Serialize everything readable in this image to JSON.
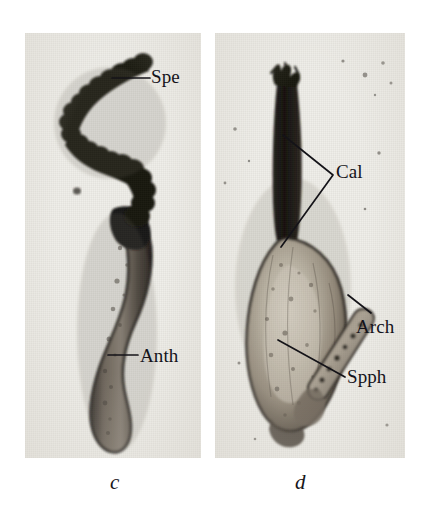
{
  "figure": {
    "kind": "micrograph-plate",
    "panel_count": 2,
    "background_color": "#efeee9",
    "ink_color": "#14131a"
  },
  "panels": [
    {
      "id": "c",
      "caption": "c",
      "subject": "antheridium with spermatogenous tissue",
      "labels": [
        {
          "key": "spe",
          "text": "Spe",
          "meaning": "spermatogenous tissue",
          "leader": "horizontal"
        },
        {
          "key": "anth",
          "text": "Anth",
          "meaning": "antheridium",
          "leader": "horizontal"
        }
      ]
    },
    {
      "id": "d",
      "caption": "d",
      "subject": "young sporophyte with calyptra and archegonium",
      "labels": [
        {
          "key": "cal",
          "text": "Cal",
          "meaning": "calyptra",
          "leader": "two-pronged-chevron"
        },
        {
          "key": "arch",
          "text": "Arch",
          "meaning": "archegonium",
          "leader": "short-diagonal"
        },
        {
          "key": "spph",
          "text": "Spph",
          "meaning": "sporophyte",
          "leader": "long-diagonal"
        }
      ]
    }
  ],
  "captions": {
    "left": "c",
    "right": "d"
  },
  "label_text": {
    "spe": "Spe",
    "anth": "Anth",
    "cal": "Cal",
    "arch": "Arch",
    "spph": "Spph"
  }
}
